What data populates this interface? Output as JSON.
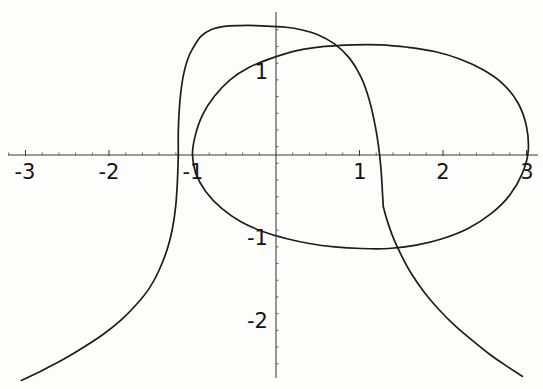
{
  "figure": {
    "title": "",
    "background_color": "#fdfdfc",
    "curve_color": "#1d1d1d",
    "axis_color": "#3a3a3a",
    "width": 543,
    "height": 389
  },
  "axes": {
    "x_tick_labels": [
      "-3",
      "-2",
      "-1",
      "1",
      "2",
      "3"
    ],
    "y_tick_labels": [
      "1",
      "-1",
      "-2"
    ],
    "x_tick_values": [
      -3,
      -2,
      -1,
      1,
      2,
      3
    ],
    "y_tick_values": [
      1,
      -1,
      -2
    ],
    "xlabel": "",
    "ylabel": "",
    "grid": false,
    "origin_px": {
      "x": 276,
      "y": 155
    },
    "px_per_unit": 83.5
  },
  "chart_data": {
    "type": "line",
    "title": "",
    "xlabel": "",
    "ylabel": "",
    "xlim": [
      -3.3,
      3.2
    ],
    "ylim": [
      -2.8,
      1.55
    ],
    "grid": false,
    "legend": null,
    "x_ticks": [
      -3,
      -2,
      -1,
      1,
      2,
      3
    ],
    "y_ticks": [
      1,
      -1,
      -2
    ],
    "series": [
      {
        "name": "cubic-branch-upper",
        "description": "Upper branch of cubic-like curve: rises from vertical asymptotic left tail, peaks near (0.1, 1.55), descends steeply crossing x-axis near x=1.25 and continuing to lower right.",
        "x": [
          -1.17,
          -1.17,
          -1.16,
          -1.14,
          -1.11,
          -1.06,
          -1.0,
          -0.9,
          -0.78,
          -0.62,
          -0.44,
          -0.24,
          -0.05,
          0.12,
          0.3,
          0.5,
          0.7,
          0.88,
          1.02,
          1.12,
          1.19,
          1.235,
          1.26,
          1.275,
          1.285
        ],
        "y": [
          0.0,
          0.28,
          0.52,
          0.75,
          0.95,
          1.14,
          1.27,
          1.42,
          1.5,
          1.54,
          1.55,
          1.55,
          1.54,
          1.53,
          1.5,
          1.44,
          1.33,
          1.16,
          0.93,
          0.65,
          0.34,
          0.05,
          -0.2,
          -0.45,
          -0.62
        ]
      },
      {
        "name": "cubic-branch-lower-left",
        "description": "Lower-left tail descending from the vertical asymptote near x=-1.17 down to the bottom-left corner.",
        "x": [
          -1.17,
          -1.18,
          -1.2,
          -1.24,
          -1.3,
          -1.4,
          -1.52,
          -1.68,
          -1.86,
          -2.06,
          -2.3,
          -2.55,
          -2.8,
          -3.05
        ],
        "y": [
          0.0,
          -0.3,
          -0.6,
          -0.88,
          -1.12,
          -1.38,
          -1.6,
          -1.8,
          -1.98,
          -2.14,
          -2.3,
          -2.45,
          -2.58,
          -2.7
        ]
      },
      {
        "name": "cubic-branch-lower-right",
        "description": "Lower-right tail continuing downward and to the right past x=2.5.",
        "x": [
          1.285,
          1.33,
          1.4,
          1.5,
          1.62,
          1.78,
          1.95,
          2.15,
          2.35,
          2.55,
          2.75,
          2.95
        ],
        "y": [
          -0.62,
          -0.78,
          -0.98,
          -1.2,
          -1.42,
          -1.65,
          -1.85,
          -2.05,
          -2.22,
          -2.38,
          -2.52,
          -2.65
        ]
      },
      {
        "name": "closed-oval",
        "description": "Closed oval passing through approximately (-1.0, 0), top near (1.0, 1.32), right extreme near (3.02, 0), bottom near (0.95, -1.12).",
        "x": [
          -1.0,
          -0.97,
          -0.88,
          -0.74,
          -0.55,
          -0.32,
          -0.05,
          0.25,
          0.58,
          0.92,
          1.25,
          1.58,
          1.9,
          2.2,
          2.48,
          2.72,
          2.9,
          3.0,
          3.02,
          2.95,
          2.8,
          2.58,
          2.3,
          2.0,
          1.68,
          1.35,
          1.02,
          0.7,
          0.4,
          0.12,
          -0.15,
          -0.42,
          -0.65,
          -0.84,
          -0.96,
          -1.0
        ],
        "y": [
          0.0,
          0.22,
          0.48,
          0.7,
          0.9,
          1.05,
          1.16,
          1.25,
          1.3,
          1.32,
          1.32,
          1.29,
          1.24,
          1.15,
          1.02,
          0.85,
          0.62,
          0.34,
          0.04,
          -0.22,
          -0.48,
          -0.7,
          -0.88,
          -1.0,
          -1.08,
          -1.12,
          -1.12,
          -1.1,
          -1.06,
          -1.0,
          -0.92,
          -0.8,
          -0.64,
          -0.44,
          -0.22,
          0.0
        ]
      }
    ]
  },
  "tick_positions": {
    "x": [
      {
        "label": "-3",
        "px_x": 25,
        "px_y": 162
      },
      {
        "label": "-2",
        "px_x": 109,
        "px_y": 162
      },
      {
        "label": "-1",
        "px_x": 193,
        "px_y": 162
      },
      {
        "label": "1",
        "px_x": 360,
        "px_y": 162
      },
      {
        "label": "2",
        "px_x": 443,
        "px_y": 162
      },
      {
        "label": "3",
        "px_x": 527,
        "px_y": 162
      }
    ],
    "y": [
      {
        "label": "1",
        "px_x": 268,
        "px_y": 72
      },
      {
        "label": "-1",
        "px_x": 268,
        "px_y": 238
      },
      {
        "label": "-2",
        "px_x": 268,
        "px_y": 321
      }
    ]
  }
}
